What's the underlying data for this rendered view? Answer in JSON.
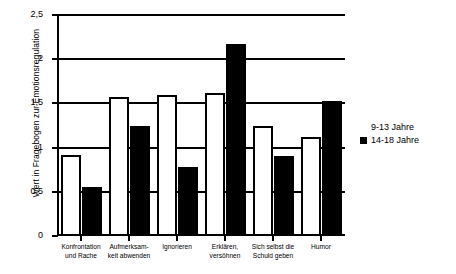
{
  "chart_data": {
    "type": "bar",
    "title": "",
    "xlabel": "",
    "ylabel": "Wert in Fragebogen zur Emotionsregulation",
    "ylim": [
      0,
      2.5
    ],
    "ytick_labels": [
      "0",
      "0,5",
      "1",
      "1,5",
      "2",
      "2,5"
    ],
    "ytick_values": [
      0,
      0.5,
      1,
      1.5,
      2,
      2.5
    ],
    "grid": "horizontal",
    "legend_position": "right",
    "categories": [
      "Konfrontation und Rache",
      "Aufmerksam- keit abwenden",
      "Ignorieren",
      "Erklären, versöhnen",
      "Sich selbst die Schuld geben",
      "Humor"
    ],
    "category_lines": [
      [
        "Konfrontation",
        "und Rache"
      ],
      [
        "Aufmerksam-",
        "keit abwenden"
      ],
      [
        "Ignorieren",
        ""
      ],
      [
        "Erklären,",
        "versöhnen"
      ],
      [
        "Sich selbst die",
        "Schuld geben"
      ],
      [
        "Humor",
        ""
      ]
    ],
    "series": [
      {
        "name": "9-13 Jahre",
        "color": "#ffffff",
        "values": [
          0.92,
          1.57,
          1.6,
          1.62,
          1.24,
          1.12
        ]
      },
      {
        "name": "14-18 Jahre",
        "color": "#000000",
        "values": [
          0.56,
          1.25,
          0.78,
          2.17,
          0.91,
          1.53
        ]
      }
    ]
  },
  "legend": {
    "items": [
      {
        "label": "9-13 Jahre",
        "style": "light"
      },
      {
        "label": "14-18 Jahre",
        "style": "dark"
      }
    ]
  }
}
